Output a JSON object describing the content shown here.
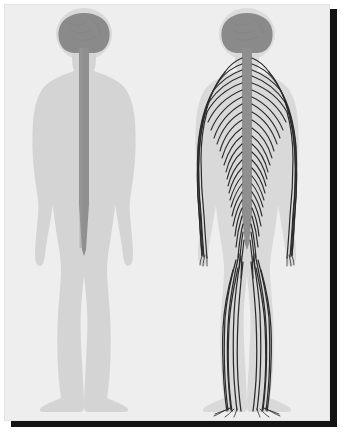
{
  "document": {
    "type": "anatomical-illustration",
    "subject": "Human nervous system",
    "background_color": "#eeeeee",
    "page_border_color": "#141414"
  },
  "figures": [
    {
      "id": "central-nervous-system",
      "label": "Central nervous system figure",
      "position": "left",
      "body_color": "#d4d4d4",
      "head_halo_color": "#d9d9d9",
      "brain_color": "#8a8a8a",
      "spinal_cord_color": "#8f8f8f",
      "parts": [
        {
          "name": "brain",
          "color": "#8a8a8a"
        },
        {
          "name": "spinal-cord",
          "color": "#8f8f8f"
        },
        {
          "name": "body-silhouette",
          "color": "#d4d4d4"
        }
      ]
    },
    {
      "id": "peripheral-nervous-system",
      "label": "Peripheral nervous system figure",
      "position": "right",
      "body_color": "#d9d9d9",
      "head_halo_color": "#dcdcdc",
      "brain_color": "#8a8a8a",
      "spinal_cord_color": "#9a9a9a",
      "nerve_color": "#2b2b2b",
      "parts": [
        {
          "name": "brain",
          "color": "#8a8a8a"
        },
        {
          "name": "spinal-cord",
          "color": "#9a9a9a"
        },
        {
          "name": "peripheral-nerves",
          "color": "#2b2b2b"
        },
        {
          "name": "body-silhouette",
          "color": "#d9d9d9"
        }
      ]
    }
  ],
  "colors": {
    "background": "#eeeeee",
    "body_light": "#d4d4d4",
    "body_light_alt": "#d9d9d9",
    "brain": "#8a8a8a",
    "cord": "#8f8f8f",
    "nerve": "#2b2b2b",
    "border": "#141414"
  }
}
